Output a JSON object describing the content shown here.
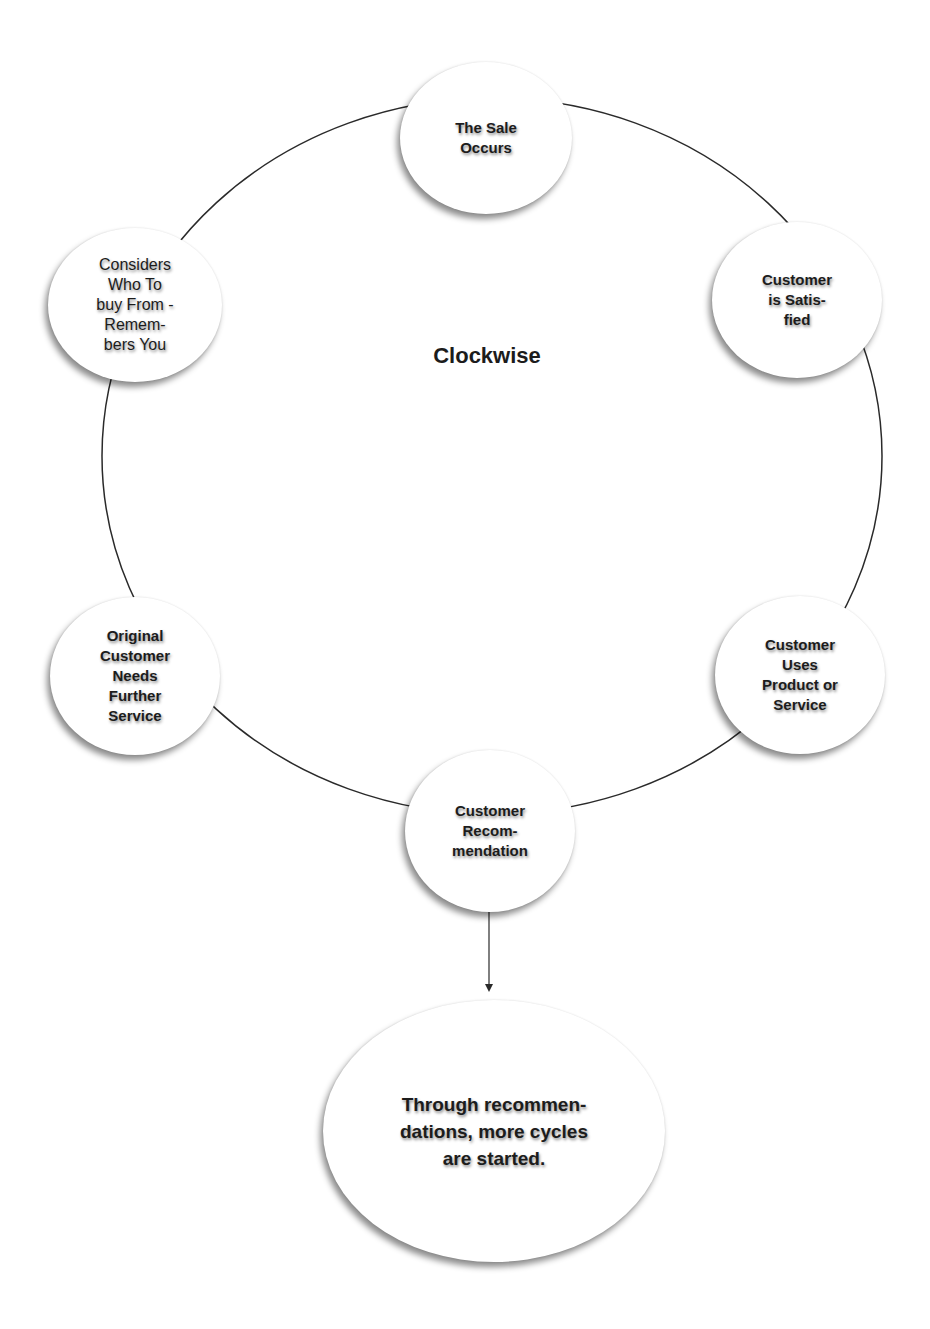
{
  "diagram": {
    "title": "Clockwise",
    "cycle_nodes": [
      {
        "id": "sale",
        "label": "The Sale\nOccurs"
      },
      {
        "id": "satisfied",
        "label": "Customer\nis Satis-\nfied"
      },
      {
        "id": "uses",
        "label": "Customer\nUses\nProduct or\nService"
      },
      {
        "id": "recommendation",
        "label": "Customer\nRecom-\nmendation"
      },
      {
        "id": "further-service",
        "label": "Original\nCustomer\nNeeds\nFurther\nService"
      },
      {
        "id": "considers",
        "label": "Considers\nWho To\nbuy From -\nRemem-\nbers You"
      }
    ],
    "outcome": {
      "label": "Through recommen-\ndations, more cycles\nare started."
    },
    "colors": {
      "background": "#ffffff",
      "line": "#2a2a2a",
      "node_fill": "#ffffff",
      "text": "#1c1c1c"
    }
  }
}
